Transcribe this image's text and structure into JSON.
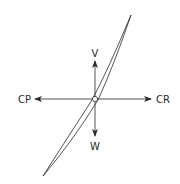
{
  "diagram": {
    "type": "force-vector diagram",
    "labels": {
      "up": "V",
      "down": "W",
      "left": "CP",
      "right": "CR"
    },
    "colors": {
      "line": "#2a2a2a",
      "background": "#ffffff"
    }
  }
}
